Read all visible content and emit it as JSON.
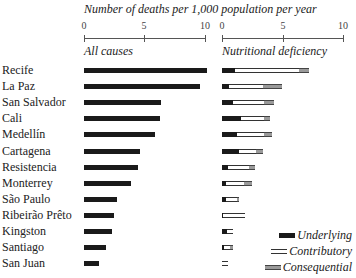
{
  "chart_data": {
    "type": "bar",
    "title": "Number of deaths per 1,000 population per year",
    "categories": [
      "Recife",
      "La Paz",
      "San Salvador",
      "Cali",
      "Medellín",
      "Cartagena",
      "Resistencia",
      "Monterrey",
      "São Paulo",
      "Ribeirão Prêto",
      "Kingston",
      "Santiago",
      "San Juan"
    ],
    "panels": [
      {
        "name": "All causes",
        "xlim": [
          0,
          10
        ],
        "ticks": [
          "0",
          "5",
          "10"
        ],
        "series": [
          {
            "name": "All causes",
            "values": [
              10.2,
              9.6,
              6.4,
              6.3,
              5.9,
              4.6,
              4.5,
              3.9,
              2.7,
              2.5,
              2.3,
              1.8,
              1.2
            ]
          }
        ]
      },
      {
        "name": "Nutritional deficiency",
        "xlim": [
          0,
          10
        ],
        "ticks": [
          "0",
          "5",
          "10"
        ],
        "stacked": true,
        "series": [
          {
            "name": "Underlying",
            "values": [
              1.1,
              0.6,
              0.9,
              1.6,
              1.2,
              1.4,
              0.5,
              0.3,
              0.3,
              0.1,
              0.4,
              0.2,
              0.0
            ]
          },
          {
            "name": "Contributory",
            "values": [
              5.3,
              2.8,
              2.6,
              1.9,
              2.3,
              1.4,
              1.7,
              1.5,
              0.9,
              1.8,
              0.5,
              0.5,
              0.5
            ]
          },
          {
            "name": "Consequential",
            "values": [
              0.8,
              1.6,
              0.8,
              0.5,
              0.6,
              0.6,
              0.5,
              0.7,
              0.2,
              0.0,
              0.0,
              0.2,
              0.0
            ]
          }
        ]
      }
    ],
    "legend": [
      "Underlying",
      "Contributory",
      "Consequential"
    ],
    "legend_position": "bottom-right",
    "grid": false
  },
  "header": {
    "title": "Number of deaths per 1,000 population per year"
  },
  "panels": {
    "left": {
      "title": "All causes",
      "ticks": [
        "0",
        "5",
        "10"
      ]
    },
    "right": {
      "title": "Nutritional deficiency",
      "ticks": [
        "0",
        "5",
        "10"
      ]
    }
  },
  "legend": {
    "underlying": "Underlying",
    "contributory": "Contributory",
    "consequential": "Consequential"
  }
}
